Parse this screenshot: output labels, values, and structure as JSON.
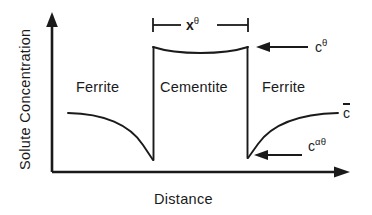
{
  "figure": {
    "type": "schematic-concentration-profile",
    "background_color": "#ffffff",
    "line_color": "#1a1a1a",
    "axes": {
      "y_label": "Solute Concentration",
      "x_label": "Distance",
      "origin_px": [
        52,
        172
      ],
      "y_axis_top_px": [
        52,
        14
      ],
      "x_axis_right_px": [
        348,
        172
      ],
      "ticks": [],
      "gridlines": false
    },
    "phases": [
      {
        "label": "Ferrite",
        "region": "left",
        "center_px": [
          110,
          88
        ]
      },
      {
        "label": "Cementite",
        "region": "middle",
        "center_px": [
          200,
          88
        ]
      },
      {
        "label": "Ferrite",
        "region": "right",
        "center_px": [
          291,
          88
        ]
      }
    ],
    "boundaries": {
      "left_interface_x_px": 153,
      "right_interface_x_px": 248,
      "precipitate_top_y_px": 47,
      "precipitate_top_sag_y_px": 53,
      "left_interface_bottom_y_px": 160,
      "right_interface_bottom_y_px": 158
    },
    "curves": [
      {
        "name": "left-ferrite-depletion-curve",
        "description": "Solute concentration decays from far-field c-bar down to the interface value at the left cementite boundary",
        "start_px": [
          68,
          113
        ],
        "end_px": [
          153,
          160
        ]
      },
      {
        "name": "precipitate-top-curve",
        "description": "Slightly concave top of the cementite plate at concentration c-theta",
        "start_px": [
          153,
          47
        ],
        "end_px": [
          248,
          47
        ]
      },
      {
        "name": "right-ferrite-recovery-curve",
        "description": "Solute concentration rises from the interface value back to the far-field level c-bar",
        "start_px": [
          248,
          158
        ],
        "end_px": [
          338,
          113
        ]
      }
    ],
    "annotations": [
      {
        "name": "plate-thickness",
        "base": "x",
        "superscript": "θ",
        "marker": "dimension-bracket",
        "span_px": [
          152,
          248
        ],
        "y_px": 25
      },
      {
        "name": "cementite-composition",
        "base": "c",
        "superscript": "θ",
        "marker": "left-arrow",
        "label_px": [
          318,
          47
        ]
      },
      {
        "name": "interface-composition",
        "base": "c",
        "superscript": "αθ",
        "marker": "left-arrow",
        "label_px": [
          312,
          146
        ]
      },
      {
        "name": "mean-composition",
        "base": "c",
        "overbar": true,
        "marker": "plain-label",
        "label_px": [
          344,
          113
        ]
      }
    ]
  }
}
